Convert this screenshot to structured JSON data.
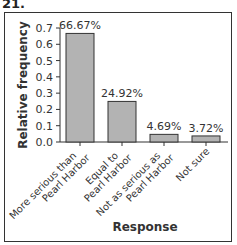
{
  "problem_number": "21.",
  "chart_data": {
    "type": "bar",
    "title": "",
    "xlabel": "Response",
    "ylabel": "Relative frequency",
    "categories": [
      "More serious than Pearl Harbor",
      "Equal to Pearl Harbor",
      "Not as serious as Pearl Harbor",
      "Not sure"
    ],
    "category_lines": [
      [
        "More serious than",
        "Pearl Harbor"
      ],
      [
        "Equal to",
        "Pearl Harbor"
      ],
      [
        "Not as serious as",
        "Pearl Harbor"
      ],
      [
        "Not sure"
      ]
    ],
    "values": [
      0.6667,
      0.2492,
      0.0469,
      0.0372
    ],
    "data_labels": [
      "66.67%",
      "24.92%",
      "4.69%",
      "3.72%"
    ],
    "yticks": [
      "0.0",
      "0.1",
      "0.2",
      "0.3",
      "0.4",
      "0.5",
      "0.6",
      "0.7"
    ],
    "ylim": [
      0,
      0.7
    ],
    "grid": false,
    "legend": null,
    "bar_color": "#b3b3b3",
    "bar_edge": "#333333"
  }
}
